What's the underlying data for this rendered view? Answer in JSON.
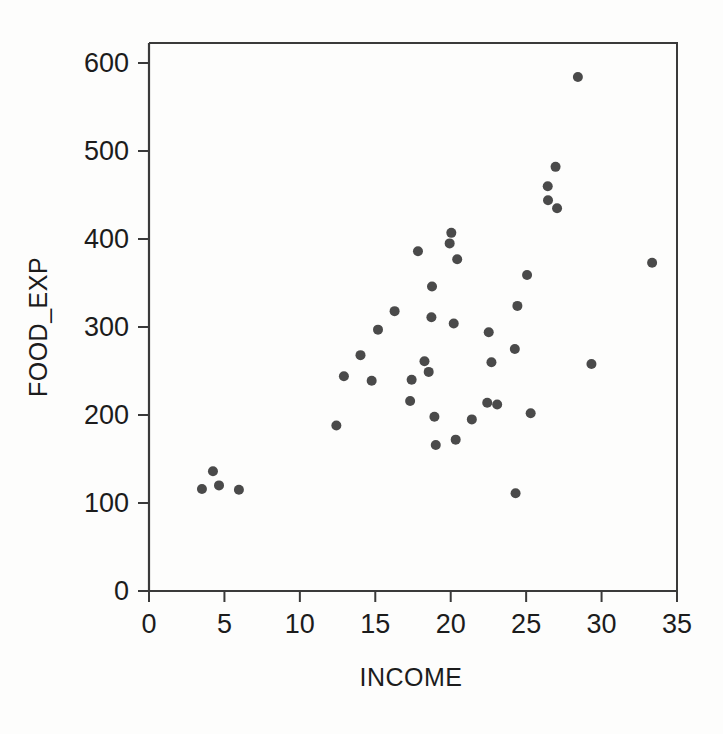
{
  "chart_data": {
    "type": "scatter",
    "title": "",
    "xlabel": "INCOME",
    "ylabel": "FOOD_EXP",
    "xlim": [
      0,
      35
    ],
    "ylim": [
      0,
      620
    ],
    "xticks": [
      0,
      5,
      10,
      15,
      20,
      25,
      30,
      35
    ],
    "yticks": [
      0,
      100,
      200,
      300,
      400,
      500,
      600
    ],
    "xtick_labels": [
      "0",
      "5",
      "10",
      "15",
      "20",
      "25",
      "30",
      "35"
    ],
    "ytick_labels": [
      "0",
      "100",
      "200",
      "300",
      "400",
      "500",
      "600"
    ],
    "grid": false,
    "legend": false,
    "marker_color": "#4a4a4a",
    "marker_size": 5,
    "n_points": 40,
    "points": [
      {
        "x": 3.51,
        "y": 116
      },
      {
        "x": 4.24,
        "y": 136
      },
      {
        "x": 4.64,
        "y": 120
      },
      {
        "x": 5.96,
        "y": 115
      },
      {
        "x": 12.42,
        "y": 188
      },
      {
        "x": 12.92,
        "y": 244
      },
      {
        "x": 14.02,
        "y": 268
      },
      {
        "x": 14.76,
        "y": 239
      },
      {
        "x": 15.18,
        "y": 297
      },
      {
        "x": 16.28,
        "y": 318
      },
      {
        "x": 17.31,
        "y": 216
      },
      {
        "x": 17.41,
        "y": 240
      },
      {
        "x": 17.83,
        "y": 386
      },
      {
        "x": 18.26,
        "y": 261
      },
      {
        "x": 18.54,
        "y": 249
      },
      {
        "x": 18.72,
        "y": 311
      },
      {
        "x": 18.76,
        "y": 346
      },
      {
        "x": 18.92,
        "y": 198
      },
      {
        "x": 19.01,
        "y": 166
      },
      {
        "x": 19.93,
        "y": 395
      },
      {
        "x": 20.04,
        "y": 407
      },
      {
        "x": 20.2,
        "y": 304
      },
      {
        "x": 20.33,
        "y": 172
      },
      {
        "x": 20.43,
        "y": 377
      },
      {
        "x": 21.4,
        "y": 195
      },
      {
        "x": 22.42,
        "y": 214
      },
      {
        "x": 22.52,
        "y": 294
      },
      {
        "x": 22.7,
        "y": 260
      },
      {
        "x": 23.08,
        "y": 212
      },
      {
        "x": 24.25,
        "y": 275
      },
      {
        "x": 24.3,
        "y": 111
      },
      {
        "x": 24.42,
        "y": 324
      },
      {
        "x": 25.06,
        "y": 359
      },
      {
        "x": 25.3,
        "y": 202
      },
      {
        "x": 26.43,
        "y": 460
      },
      {
        "x": 26.45,
        "y": 444
      },
      {
        "x": 26.95,
        "y": 482
      },
      {
        "x": 27.05,
        "y": 435
      },
      {
        "x": 28.43,
        "y": 584
      },
      {
        "x": 29.33,
        "y": 258
      },
      {
        "x": 33.35,
        "y": 373
      }
    ]
  },
  "axes": {
    "x_axis_name": "x-axis",
    "y_axis_name": "y-axis"
  }
}
